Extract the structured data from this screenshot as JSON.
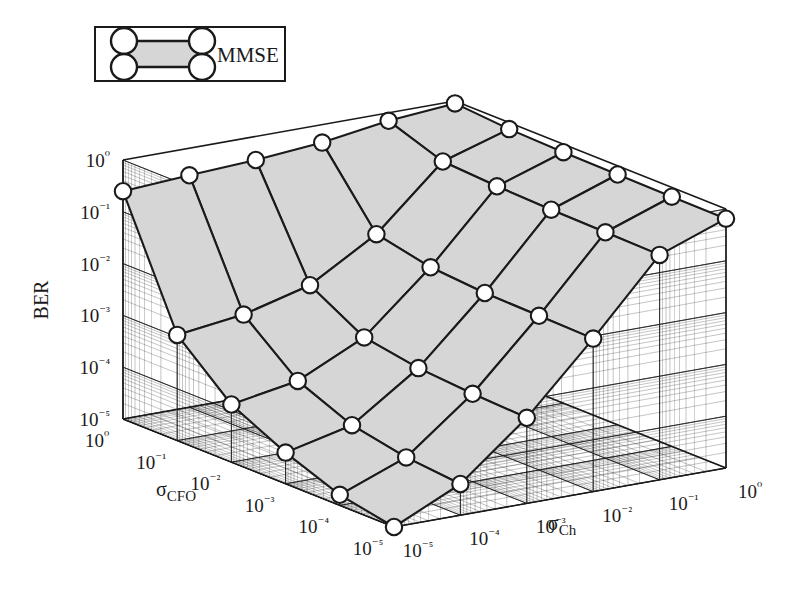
{
  "figure": {
    "type": "surface-3d",
    "background": "#ffffff",
    "ink": "#1a1a1a",
    "surface_fill": "#d6d6d6",
    "marker_fill": "#ffffff",
    "marker_stroke": "#1a1a1a"
  },
  "legend": {
    "entries": [
      {
        "label": "MMSE",
        "icon": "surface-patch-icon",
        "fill": "#d6d6d6"
      }
    ]
  },
  "axes": {
    "z": {
      "name": "BER",
      "ticks": [
        "10⁰",
        "10⁻¹",
        "10⁻²",
        "10⁻³",
        "10⁻⁴",
        "10⁻⁵"
      ],
      "tick_values": [
        1,
        0.1,
        0.01,
        0.001,
        0.0001,
        1e-05
      ],
      "scale": "log"
    },
    "x": {
      "name": "σ",
      "subscript": "CFO",
      "ticks": [
        "10⁰",
        "10⁻¹",
        "10⁻²",
        "10⁻³",
        "10⁻⁴",
        "10⁻⁵"
      ],
      "tick_values": [
        1,
        0.1,
        0.01,
        0.001,
        0.0001,
        1e-05
      ],
      "scale": "log"
    },
    "y": {
      "name": "σ",
      "subscript": "Ch",
      "ticks": [
        "10⁻⁵",
        "10⁻⁴",
        "10⁻³",
        "10⁻²",
        "10⁻¹",
        "10⁰"
      ],
      "tick_values": [
        1e-05,
        0.0001,
        0.001,
        0.01,
        0.1,
        1
      ],
      "scale": "log"
    }
  },
  "chart_data": {
    "type": "surface",
    "title": "",
    "xlabel": "σ_CFO",
    "ylabel": "σ_Ch",
    "zlabel": "BER",
    "xscale": "log",
    "yscale": "log",
    "zscale": "log",
    "xlim": [
      1e-05,
      1
    ],
    "ylim": [
      1e-05,
      1
    ],
    "zlim": [
      1e-05,
      1
    ],
    "grid": true,
    "legend_position": "top-left",
    "series_name": "MMSE",
    "x_categories": [
      1,
      0.1,
      0.01,
      0.001,
      0.0001,
      1e-05
    ],
    "y_categories": [
      1e-05,
      0.0001,
      0.001,
      0.01,
      0.1,
      1
    ],
    "z_matrix": [
      [
        0.25,
        0.3,
        0.35,
        0.45,
        0.7,
        0.9
      ],
      [
        0.0011,
        0.0016,
        0.0035,
        0.02,
        0.3,
        0.75
      ],
      [
        0.00013,
        0.00022,
        0.0009,
        0.012,
        0.26,
        0.7
      ],
      [
        4e-05,
        8e-05,
        0.0006,
        0.01,
        0.24,
        0.68
      ],
      [
        1.6e-05,
        5e-05,
        0.0005,
        0.0095,
        0.23,
        0.66
      ],
      [
        1e-05,
        4e-05,
        0.00045,
        0.009,
        0.22,
        0.65
      ]
    ],
    "z_matrix_note": "rows = sigma_CFO from 1e0 down to 1e-5; cols = sigma_Ch from 1e-5 up to 1e0"
  }
}
